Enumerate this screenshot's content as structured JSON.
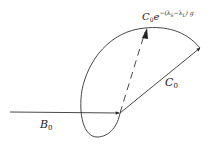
{
  "diagram": {
    "labels": {
      "b0": {
        "main": "B",
        "sub": "0"
      },
      "c0": {
        "main": "C",
        "sub": "0"
      },
      "decay": {
        "main": "C",
        "sub": "0",
        "e": "e",
        "exponent": "−(λ",
        "s1": "S",
        "mid": "−λ",
        "s2": "L",
        "tail": ") g"
      }
    },
    "colors": {
      "stroke": "#333333",
      "background": "#ffffff"
    }
  }
}
